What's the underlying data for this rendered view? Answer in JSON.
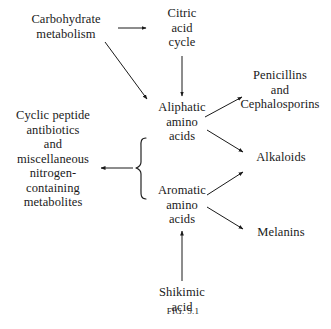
{
  "figure": {
    "caption": "FIG. 5.1",
    "caption_label": "Fig.",
    "caption_number": "5.1",
    "background_color": "#ffffff",
    "ink_color": "#1a1a1a"
  },
  "nodes": {
    "carbohydrate": {
      "lines": [
        "Carbohydrate",
        "metabolism"
      ]
    },
    "citric": {
      "lines": [
        "Citric",
        "acid",
        "cycle"
      ]
    },
    "aliphatic": {
      "lines": [
        "Aliphatic",
        "amino",
        "acids"
      ]
    },
    "aromatic": {
      "lines": [
        "Aromatic",
        "amino",
        "acids"
      ]
    },
    "shikimic": {
      "lines": [
        "Shikimic",
        "acid"
      ]
    },
    "cyclic": {
      "lines": [
        "Cyclic peptide",
        "antibiotics",
        "and",
        "miscellaneous",
        "nitrogen-",
        "containing",
        "metabolites"
      ]
    },
    "penicillins": {
      "lines": [
        "Penicillins",
        "and",
        "Cephalosporins"
      ]
    },
    "alkaloids": {
      "lines": [
        "Alkaloids"
      ]
    },
    "melanins": {
      "lines": [
        "Melanins"
      ]
    }
  },
  "edges": [
    {
      "id": "carbohydrate-to-citric",
      "from": "carbohydrate",
      "to": "citric",
      "style": "horizontal-arrow"
    },
    {
      "id": "carbohydrate-to-aliphatic",
      "from": "carbohydrate",
      "to": "aliphatic",
      "style": "diagonal-arrow"
    },
    {
      "id": "citric-to-aliphatic",
      "from": "citric",
      "to": "aliphatic",
      "style": "vertical-arrow"
    },
    {
      "id": "aliphatic-to-penicillins",
      "from": "aliphatic",
      "to": "penicillins",
      "style": "diagonal-arrow"
    },
    {
      "id": "aliphatic-to-alkaloids",
      "from": "aliphatic",
      "to": "alkaloids",
      "style": "diagonal-arrow"
    },
    {
      "id": "aromatic-to-alkaloids",
      "from": "aromatic",
      "to": "alkaloids",
      "style": "diagonal-arrow"
    },
    {
      "id": "aromatic-to-melanins",
      "from": "aromatic",
      "to": "melanins",
      "style": "diagonal-arrow"
    },
    {
      "id": "shikimic-to-aromatic",
      "from": "shikimic",
      "to": "aromatic",
      "style": "vertical-arrow"
    },
    {
      "id": "brace-to-cyclic",
      "from": "amino-acid-brace",
      "to": "cyclic",
      "style": "horizontal-arrow"
    }
  ],
  "brace": {
    "groups": [
      "aliphatic",
      "aromatic"
    ],
    "orientation": "opens-right"
  }
}
